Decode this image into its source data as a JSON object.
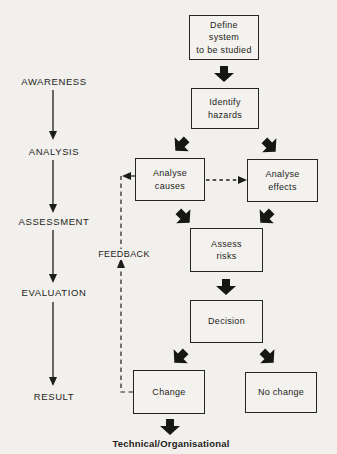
{
  "diagram": {
    "stages": [
      "AWARENESS",
      "ANALYSIS",
      "ASSESSMENT",
      "EVALUATION",
      "RESULT"
    ],
    "nodes": {
      "define_system": "Define\nsystem\nto be studied",
      "identify_hazards": "Identify\nhazards",
      "analyse_causes": "Analyse\ncauses",
      "analyse_effects": "Analyse\neffects",
      "assess_risks": "Assess\nrisks",
      "decision": "Decision",
      "change": "Change",
      "no_change": "No change"
    },
    "feedback_label": "FEEDBACK",
    "footer_label": "Technical/Organisational",
    "colors": {
      "ink": "#1d1d1b",
      "background": "#f2f0ec"
    }
  }
}
